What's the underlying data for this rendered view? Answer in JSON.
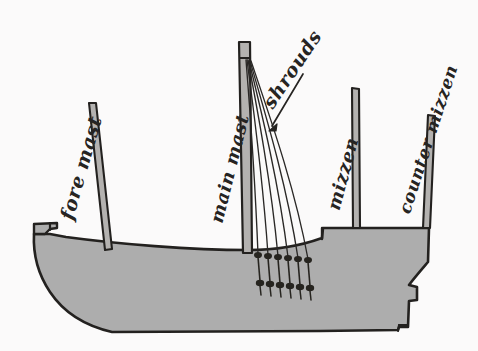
{
  "figure": {
    "kind": "hand-drawn-diagram",
    "background_color": "#fbfafa",
    "ink_color": "#262422",
    "hull_fill_color": "#adadad",
    "mast_fill_color": "#b4b2b0"
  },
  "labels": {
    "fore_mast": "fore mast",
    "main_mast": "main mast",
    "shrouds": "shrouds",
    "mizzen": "mizzen",
    "counter_mizzen": "counter mizzen"
  },
  "parts": {
    "hull": "hull",
    "bow_prow": "bow-prow",
    "stern_step": "stern-step",
    "deck_line": "deck-line",
    "shroud_count": 6,
    "deadeye_count": 12,
    "leader_line": "shrouds-leader-line"
  }
}
